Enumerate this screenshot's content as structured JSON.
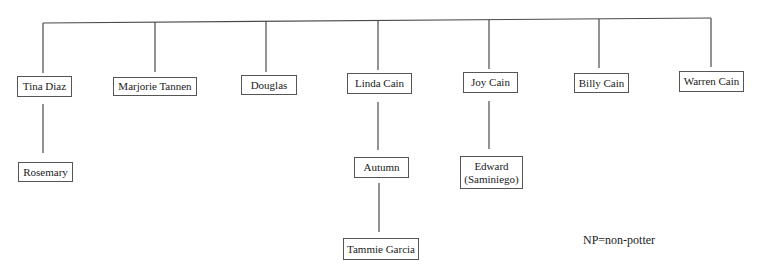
{
  "diagram": {
    "type": "family-tree",
    "line_color": "#4a4a4a",
    "generation_1": [
      {
        "id": "tina",
        "label": "Tina Diaz",
        "box": [
          17,
          76,
          55,
          21
        ],
        "stem_x": 43
      },
      {
        "id": "marjorie",
        "label": "Marjorie Tannen",
        "box": [
          113,
          77,
          84,
          19
        ],
        "stem_x": 155
      },
      {
        "id": "douglas",
        "label": "Douglas",
        "box": [
          241,
          75,
          56,
          20
        ],
        "stem_x": 266
      },
      {
        "id": "linda",
        "label": "Linda Cain",
        "box": [
          347,
          73,
          65,
          21
        ],
        "stem_x": 378
      },
      {
        "id": "joy",
        "label": "Joy Cain",
        "box": [
          463,
          72,
          55,
          21
        ],
        "stem_x": 489
      },
      {
        "id": "billy",
        "label": "Billy Cain",
        "box": [
          574,
          73,
          55,
          20
        ],
        "stem_x": 599
      },
      {
        "id": "warren",
        "label": "Warren Cain",
        "box": [
          679,
          71,
          65,
          21
        ],
        "stem_x": 711
      }
    ],
    "children": [
      {
        "id": "rosemary",
        "parent": "tina",
        "label": "Rosemary",
        "box": [
          18,
          162,
          55,
          20
        ]
      },
      {
        "id": "autumn",
        "parent": "linda",
        "label": "Autumn",
        "box": [
          354,
          157,
          55,
          21
        ]
      },
      {
        "id": "edward",
        "parent": "joy",
        "label_line1": "Edward",
        "label_line2": "(Saminiego)",
        "box": [
          460,
          156,
          63,
          33
        ]
      },
      {
        "id": "tammie",
        "parent": "autumn",
        "label": "Tammie Garcia",
        "box": [
          343,
          238,
          76,
          22
        ]
      }
    ],
    "note": "NP=non-potter"
  }
}
